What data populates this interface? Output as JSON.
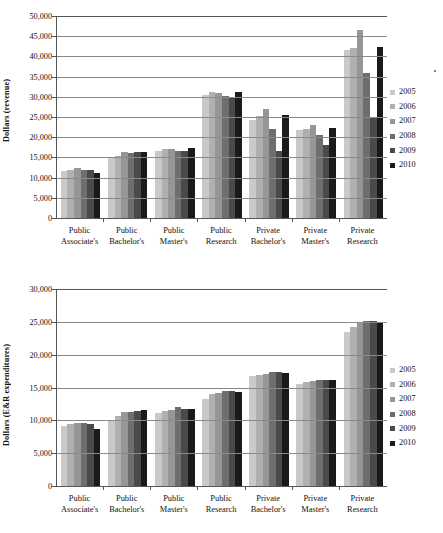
{
  "figure": {
    "legend_title": "",
    "series_colors": [
      "#c9c9c9",
      "#b0b0b0",
      "#969696",
      "#6e6e6e",
      "#4a4a4a",
      "#1a1a1a"
    ],
    "legend_position": "right",
    "grid": true
  },
  "legend": {
    "entries": [
      {
        "label": "2005",
        "color": "#c9c9c9"
      },
      {
        "label": "2006",
        "color": "#b0b0b0"
      },
      {
        "label": "2007",
        "color": "#969696"
      },
      {
        "label": "2008",
        "color": "#6e6e6e"
      },
      {
        "label": "2009",
        "color": "#4a4a4a"
      },
      {
        "label": "2010",
        "color": "#1a1a1a"
      }
    ]
  },
  "chart_data": [
    {
      "id": "revenue",
      "type": "bar",
      "title": "",
      "xlabel": "",
      "ylabel": "Dollars (revenue)",
      "ylim": [
        0,
        50000
      ],
      "ytick_step": 5000,
      "ytick_labels": [
        "50,000",
        "45,000",
        "40,000",
        "35,000",
        "30,000",
        "25,000",
        "20,000",
        "15,000",
        "10,000",
        "5,000",
        "0"
      ],
      "grid": true,
      "legend_position": "right",
      "categories": [
        "Public Associate's",
        "Public Bachelor's",
        "Public Master's",
        "Public Research",
        "Private Bachelor's",
        "Private Master's",
        "Private Research"
      ],
      "category_lines": [
        [
          "Public",
          "Associate's"
        ],
        [
          "Public",
          "Bachelor's"
        ],
        [
          "Public",
          "Master's"
        ],
        [
          "Public",
          "Research"
        ],
        [
          "Private",
          "Bachelor's"
        ],
        [
          "Private",
          "Master's"
        ],
        [
          "Private",
          "Research"
        ]
      ],
      "series": [
        {
          "name": "2005",
          "color": "#c9c9c9",
          "values": [
            11600,
            15200,
            16500,
            30400,
            24300,
            21800,
            41500
          ]
        },
        {
          "name": "2006",
          "color": "#b0b0b0",
          "values": [
            11800,
            15400,
            17200,
            31100,
            25300,
            22000,
            42000
          ]
        },
        {
          "name": "2007",
          "color": "#969696",
          "values": [
            12400,
            16400,
            17100,
            31000,
            27000,
            23000,
            46500
          ]
        },
        {
          "name": "2008",
          "color": "#6e6e6e",
          "values": [
            12000,
            16100,
            16500,
            30300,
            22100,
            20500,
            36000
          ]
        },
        {
          "name": "2009",
          "color": "#4a4a4a",
          "values": [
            11800,
            16300,
            16500,
            30000,
            16700,
            18000,
            24800
          ]
        },
        {
          "name": "2010",
          "color": "#1a1a1a",
          "values": [
            11200,
            16400,
            17300,
            31100,
            25400,
            22300,
            42400
          ]
        }
      ]
    },
    {
      "id": "expenditures",
      "type": "bar",
      "title": "",
      "xlabel": "",
      "ylabel": "Dollars (E&R expenditures)",
      "ylim": [
        0,
        30000
      ],
      "ytick_step": 5000,
      "ytick_labels": [
        "30,000",
        "25,000",
        "20,000",
        "15,000",
        "10,000",
        "5,000",
        "0"
      ],
      "grid": true,
      "legend_position": "right",
      "categories": [
        "Public Associate's",
        "Public Bachelor's",
        "Public Master's",
        "Public Research",
        "Private Bachelor's",
        "Private Master's",
        "Private Research"
      ],
      "category_lines": [
        [
          "Public",
          "Associate's"
        ],
        [
          "Public",
          "Bachelor's"
        ],
        [
          "Public",
          "Master's"
        ],
        [
          "Public",
          "Research"
        ],
        [
          "Private",
          "Bachelor's"
        ],
        [
          "Private",
          "Master's"
        ],
        [
          "Private",
          "Research"
        ]
      ],
      "series": [
        {
          "name": "2005",
          "color": "#c9c9c9",
          "values": [
            9100,
            10100,
            11100,
            13300,
            16800,
            15500,
            23400
          ]
        },
        {
          "name": "2006",
          "color": "#b0b0b0",
          "values": [
            9400,
            10600,
            11400,
            14000,
            16900,
            15900,
            24200
          ]
        },
        {
          "name": "2007",
          "color": "#969696",
          "values": [
            9600,
            11200,
            11600,
            14200,
            17000,
            16000,
            25000
          ]
        },
        {
          "name": "2008",
          "color": "#6e6e6e",
          "values": [
            9600,
            11300,
            12000,
            14500,
            17300,
            16200,
            25200
          ]
        },
        {
          "name": "2009",
          "color": "#4a4a4a",
          "values": [
            9500,
            11400,
            11800,
            14400,
            17400,
            16200,
            25100
          ]
        },
        {
          "name": "2010",
          "color": "#1a1a1a",
          "values": [
            8700,
            11500,
            11700,
            14300,
            17200,
            16100,
            24900
          ]
        }
      ]
    }
  ]
}
